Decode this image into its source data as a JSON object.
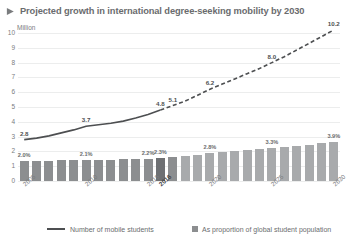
{
  "title": {
    "bullet_icon": "right-arrow-icon",
    "text": "Projected growth in international degree-seeking mobility by 2030"
  },
  "chart_data": {
    "type": "line",
    "title": "Projected growth in international degree-seeking mobility by 2030",
    "xlabel": "",
    "ylabel": "Million",
    "unit_label": "Million",
    "ylim": [
      0,
      10
    ],
    "yticks": [
      "0",
      "1",
      "2",
      "3",
      "4",
      "5",
      "6",
      "7",
      "8",
      "9",
      "10"
    ],
    "grid": true,
    "legend_position": "bottom",
    "categories": [
      "2005",
      "2006",
      "2007",
      "2008",
      "2009",
      "2010",
      "2011",
      "2012",
      "2013",
      "2014",
      "2015",
      "2016",
      "2017",
      "2018",
      "2019",
      "2020",
      "2021",
      "2022",
      "2023",
      "2024",
      "2025",
      "2026",
      "2027",
      "2028",
      "2029",
      "2030"
    ],
    "xtick_labels": [
      "2005",
      "2010",
      "2015",
      "2016",
      "2020",
      "2025",
      "2030"
    ],
    "series": [
      {
        "name": "Number of mobile students",
        "type": "line",
        "unit": "million",
        "values": [
          2.8,
          2.9,
          3.05,
          3.25,
          3.45,
          3.7,
          3.8,
          3.9,
          4.05,
          4.25,
          4.5,
          4.8,
          5.1,
          5.4,
          5.8,
          6.2,
          6.55,
          6.9,
          7.25,
          7.6,
          8.0,
          8.4,
          8.85,
          9.3,
          9.75,
          10.2
        ],
        "point_labels": [
          {
            "category": "2005",
            "value": 2.8,
            "text": "2.8"
          },
          {
            "category": "2010",
            "value": 3.7,
            "text": "3.7"
          },
          {
            "category": "2016",
            "value": 4.8,
            "text": "4.8"
          },
          {
            "category": "2017",
            "value": 5.1,
            "text": "5.1"
          },
          {
            "category": "2020",
            "value": 6.2,
            "text": "6.2"
          },
          {
            "category": "2025",
            "value": 8.0,
            "text": "8.0"
          },
          {
            "category": "2030",
            "value": 10.2,
            "text": "10.2"
          }
        ],
        "actual_through": "2016",
        "projected_from": "2017",
        "actual_style": "solid",
        "projected_style": "dashed",
        "color": "#4d4f51"
      },
      {
        "name": "As proportion of global student population",
        "type": "bar",
        "unit": "percent",
        "values": [
          2.0,
          2.0,
          2.0,
          2.05,
          2.05,
          2.1,
          2.1,
          2.1,
          2.15,
          2.2,
          2.2,
          2.3,
          2.35,
          2.45,
          2.6,
          2.8,
          2.9,
          3.0,
          3.05,
          3.15,
          3.3,
          3.4,
          3.5,
          3.6,
          3.75,
          3.9
        ],
        "point_labels": [
          {
            "category": "2005",
            "value": 2.0,
            "text": "2.0%"
          },
          {
            "category": "2010",
            "value": 2.1,
            "text": "2.1%"
          },
          {
            "category": "2015",
            "value": 2.2,
            "text": "2.2%"
          },
          {
            "category": "2016",
            "value": 2.3,
            "text": "2.3%"
          },
          {
            "category": "2020",
            "value": 2.8,
            "text": "2.8%"
          },
          {
            "category": "2025",
            "value": 3.3,
            "text": "3.3%"
          },
          {
            "category": "2030",
            "value": 3.9,
            "text": "3.9%"
          }
        ],
        "actual_through": "2016",
        "projected_from": "2017",
        "color": "#8c8e90",
        "projected_color": "#a8aaac"
      }
    ]
  },
  "legend": {
    "line_label": "Number of mobile students",
    "bar_label": "As proportion of global student population"
  },
  "colors": {
    "line": "#4d4f51",
    "bar": "#8c8e90",
    "bar_projected": "#a8aaac",
    "grid": "#eceded",
    "text": "#6a6c6e"
  }
}
